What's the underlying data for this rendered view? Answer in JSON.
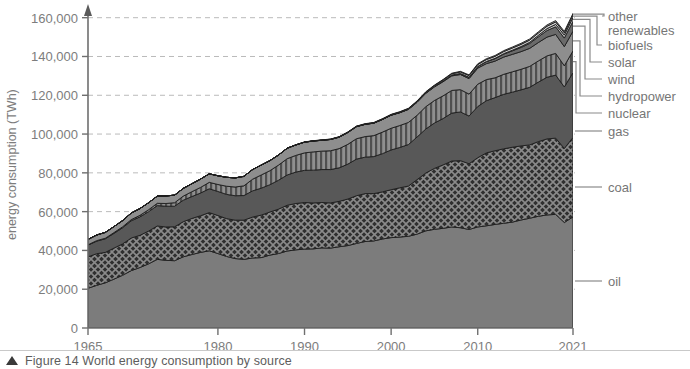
{
  "caption": {
    "marker": "triangle",
    "text": "Figure 14 World energy consumption by source"
  },
  "chart_data": {
    "type": "area",
    "stacked": true,
    "title": "",
    "xlabel": "",
    "ylabel": "energy consumption (TWh)",
    "xlim": [
      1965,
      2021
    ],
    "ylim": [
      0,
      165000
    ],
    "xticks": [
      1965,
      1980,
      1990,
      2000,
      2010,
      2021
    ],
    "xticklabels": [
      "1965",
      "1980",
      "1990",
      "2000",
      "2010",
      "2021"
    ],
    "yticks": [
      0,
      20000,
      40000,
      60000,
      80000,
      100000,
      120000,
      140000,
      160000
    ],
    "yticklabels": [
      "0",
      "20,000",
      "40,000",
      "60,000",
      "80,000",
      "100,000",
      "120,000",
      "140,000",
      "160,000"
    ],
    "grid": "horizontal-dashed",
    "legend_position": "right-leader-lines",
    "x": [
      1965,
      1966,
      1967,
      1968,
      1969,
      1970,
      1971,
      1972,
      1973,
      1974,
      1975,
      1976,
      1977,
      1978,
      1979,
      1980,
      1981,
      1982,
      1983,
      1984,
      1985,
      1986,
      1987,
      1988,
      1989,
      1990,
      1991,
      1992,
      1993,
      1994,
      1995,
      1996,
      1997,
      1998,
      1999,
      2000,
      2001,
      2002,
      2003,
      2004,
      2005,
      2006,
      2007,
      2008,
      2009,
      2010,
      2011,
      2012,
      2013,
      2014,
      2015,
      2016,
      2017,
      2018,
      2019,
      2020,
      2021
    ],
    "series": [
      {
        "name": "oil",
        "fill": "#7c7c7c",
        "pattern": "solid",
        "values": [
          20500,
          22000,
          23300,
          25200,
          27200,
          29600,
          31200,
          33100,
          35400,
          34900,
          34700,
          36700,
          37900,
          39000,
          39800,
          38400,
          36900,
          35800,
          35400,
          36100,
          36300,
          37600,
          38400,
          39700,
          40300,
          40700,
          40800,
          41300,
          41200,
          41900,
          42500,
          43600,
          44600,
          44900,
          45900,
          46600,
          46900,
          47300,
          48400,
          50100,
          50900,
          51400,
          52100,
          51700,
          50800,
          52100,
          52700,
          53400,
          54000,
          54600,
          55700,
          56600,
          57600,
          58300,
          58600,
          54400,
          57300
        ]
      },
      {
        "name": "coal",
        "fill": "#3a3a3a",
        "pattern": "crosshatch",
        "values": [
          16200,
          16300,
          15700,
          16000,
          16200,
          16800,
          16600,
          16900,
          17200,
          17200,
          17500,
          18100,
          18600,
          18900,
          19700,
          19600,
          19500,
          19800,
          20200,
          21100,
          21900,
          22200,
          22900,
          23600,
          23900,
          24000,
          23700,
          23400,
          23300,
          23400,
          24000,
          24600,
          24700,
          24400,
          24300,
          24700,
          25400,
          25900,
          28100,
          29800,
          31400,
          32700,
          34000,
          34600,
          33900,
          35700,
          37600,
          38000,
          38400,
          38600,
          38200,
          37800,
          38500,
          39200,
          39300,
          38200,
          41000
        ]
      },
      {
        "name": "gas",
        "fill": "#585858",
        "pattern": "solid",
        "values": [
          6000,
          6500,
          7000,
          7600,
          8300,
          8900,
          9500,
          10000,
          10500,
          10700,
          10600,
          11100,
          11300,
          11700,
          12300,
          12400,
          12500,
          12600,
          12700,
          13500,
          13900,
          14100,
          14900,
          15600,
          16200,
          16600,
          16900,
          17000,
          17200,
          17300,
          18000,
          18900,
          18800,
          19100,
          19700,
          20500,
          20800,
          21400,
          22000,
          22700,
          23400,
          23900,
          24700,
          25100,
          24600,
          26400,
          26900,
          27400,
          28100,
          28400,
          28900,
          29700,
          30700,
          31800,
          32500,
          31700,
          33400
        ]
      },
      {
        "name": "nuclear",
        "fill": "#9a9a9a",
        "pattern": "vertical-stripes",
        "values": [
          200,
          250,
          300,
          400,
          500,
          600,
          800,
          1000,
          1200,
          1400,
          1800,
          2100,
          2500,
          2900,
          3300,
          3600,
          4200,
          4500,
          5000,
          6000,
          6800,
          7200,
          7800,
          8400,
          8600,
          9000,
          9400,
          9500,
          9700,
          9900,
          10200,
          10500,
          10600,
          10800,
          11100,
          11200,
          11300,
          11400,
          11200,
          11500,
          11600,
          11700,
          11700,
          11500,
          11300,
          11500,
          10900,
          10200,
          10300,
          10500,
          10600,
          10800,
          10900,
          11000,
          11200,
          10900,
          11200
        ]
      },
      {
        "name": "hydropower",
        "fill": "#8e8e8e",
        "pattern": "solid",
        "values": [
          2800,
          2900,
          3000,
          3100,
          3200,
          3400,
          3500,
          3600,
          3700,
          3900,
          3900,
          4000,
          4100,
          4300,
          4400,
          4500,
          4600,
          4700,
          4900,
          5000,
          5100,
          5200,
          5200,
          5400,
          5400,
          5500,
          5600,
          5600,
          5800,
          5900,
          6100,
          6200,
          6300,
          6400,
          6500,
          6700,
          6600,
          6700,
          6700,
          6900,
          7000,
          7300,
          7500,
          7800,
          8000,
          8300,
          8200,
          8600,
          8900,
          9000,
          9100,
          9300,
          9500,
          9700,
          9800,
          9900,
          10200
        ]
      },
      {
        "name": "wind",
        "fill": "#6a6a6a",
        "pattern": "solid",
        "values": [
          0,
          0,
          0,
          0,
          0,
          0,
          0,
          0,
          0,
          0,
          0,
          0,
          0,
          0,
          0,
          0,
          0,
          0,
          0,
          0,
          0,
          0,
          0,
          0,
          0,
          10,
          12,
          15,
          20,
          25,
          30,
          40,
          50,
          60,
          80,
          90,
          110,
          140,
          170,
          210,
          260,
          330,
          420,
          520,
          660,
          830,
          1030,
          1280,
          1540,
          1830,
          2170,
          2530,
          2950,
          3400,
          3900,
          4400,
          5100
        ]
      },
      {
        "name": "solar",
        "fill": "#bdbdbd",
        "pattern": "solid",
        "values": [
          0,
          0,
          0,
          0,
          0,
          0,
          0,
          0,
          0,
          0,
          0,
          0,
          0,
          0,
          0,
          0,
          0,
          0,
          0,
          0,
          0,
          0,
          0,
          0,
          0,
          0,
          0,
          0,
          0,
          0,
          1,
          1,
          2,
          2,
          3,
          4,
          5,
          6,
          8,
          10,
          13,
          18,
          25,
          35,
          50,
          70,
          110,
          160,
          230,
          320,
          440,
          580,
          760,
          980,
          1240,
          1540,
          1950
        ]
      },
      {
        "name": "biofuels",
        "fill": "#d0d0d0",
        "pattern": "solid",
        "values": [
          0,
          0,
          0,
          0,
          0,
          0,
          0,
          0,
          0,
          0,
          0,
          0,
          0,
          0,
          0,
          0,
          0,
          0,
          0,
          0,
          0,
          0,
          0,
          0,
          0,
          70,
          80,
          90,
          100,
          110,
          120,
          140,
          150,
          160,
          180,
          200,
          220,
          250,
          300,
          350,
          420,
          520,
          630,
          760,
          850,
          940,
          1000,
          1030,
          1070,
          1120,
          1140,
          1160,
          1200,
          1230,
          1270,
          1180,
          1270
        ]
      },
      {
        "name": "other renewables",
        "fill": "#a6a6a6",
        "pattern": "solid",
        "values": [
          0,
          0,
          0,
          0,
          0,
          0,
          0,
          0,
          0,
          0,
          0,
          0,
          0,
          0,
          0,
          0,
          0,
          0,
          0,
          0,
          0,
          0,
          0,
          0,
          0,
          80,
          90,
          100,
          110,
          120,
          130,
          140,
          150,
          160,
          170,
          180,
          190,
          200,
          220,
          240,
          260,
          280,
          300,
          330,
          350,
          380,
          420,
          450,
          480,
          510,
          540,
          580,
          620,
          660,
          700,
          730,
          790
        ]
      }
    ],
    "legend": [
      {
        "label": "other",
        "key": "other"
      },
      {
        "label": "renewables",
        "key": "other-renewables"
      },
      {
        "label": "biofuels",
        "key": "biofuels"
      },
      {
        "label": "solar",
        "key": "solar"
      },
      {
        "label": "wind",
        "key": "wind"
      },
      {
        "label": "hydropower",
        "key": "hydropower"
      },
      {
        "label": "nuclear",
        "key": "nuclear"
      },
      {
        "label": "gas",
        "key": "gas"
      },
      {
        "label": "coal",
        "key": "coal"
      },
      {
        "label": "oil",
        "key": "oil"
      }
    ]
  }
}
